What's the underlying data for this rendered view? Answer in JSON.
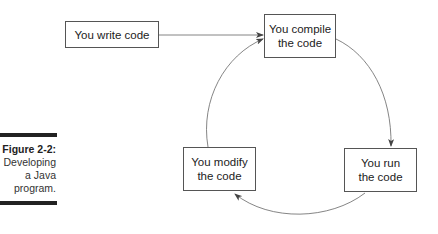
{
  "diagram": {
    "nodes": [
      {
        "id": "write",
        "label": "You write code"
      },
      {
        "id": "compile",
        "label_line1": "You compile",
        "label_line2": "the code"
      },
      {
        "id": "run",
        "label_line1": "You run",
        "label_line2": "the code"
      },
      {
        "id": "modify",
        "label_line1": "You modify",
        "label_line2": "the code"
      }
    ],
    "edges": [
      {
        "from": "write",
        "to": "compile",
        "style": "straight-arrow"
      },
      {
        "from": "compile",
        "to": "run",
        "style": "curved-arrow"
      },
      {
        "from": "run",
        "to": "modify",
        "style": "curved-arrow"
      },
      {
        "from": "modify",
        "to": "compile",
        "style": "curved-arrow"
      }
    ]
  },
  "caption": {
    "title": "Figure 2-2:",
    "line1": "Developing",
    "line2": "a Java",
    "line3": "program."
  },
  "colors": {
    "line": "#555555",
    "bar": "#222222"
  }
}
